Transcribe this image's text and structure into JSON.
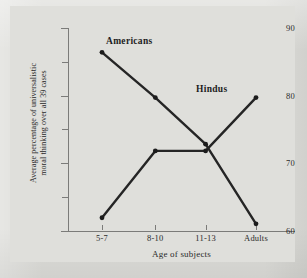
{
  "figure": {
    "background_color": "#dcdcd8",
    "plot_background_color": "#dfdfdb",
    "axis_color": "#7b7b79",
    "line_color": "#252525"
  },
  "chart_data": {
    "type": "line",
    "title": "",
    "xlabel": "Age of subjects",
    "ylabel": "Average percentage of universalistic moral thinking over all 39 cases",
    "ylabel_line1": "Average percentage of universalistic",
    "ylabel_line2": "moral thinking over all 39 cases",
    "categories": [
      "5-7",
      "8-10",
      "11-13",
      "Adults"
    ],
    "ylim": [
      60,
      90
    ],
    "yticks": [
      60,
      70,
      80,
      90
    ],
    "ytick_labels": [
      "60",
      "70",
      "80",
      "90"
    ],
    "yminor_ticks": [
      65,
      75,
      85
    ],
    "grid": false,
    "legend_position": "inline-annotations",
    "series": [
      {
        "name": "Americans",
        "values": [
          86.4,
          79.7,
          72.8,
          61.0
        ],
        "marker": "filled-circle"
      },
      {
        "name": "Hindus",
        "values": [
          61.9,
          71.8,
          71.8,
          79.7
        ],
        "marker": "filled-circle"
      }
    ],
    "annotations": [
      {
        "text": "Americans",
        "series": "Americans"
      },
      {
        "text": "Hindus",
        "series": "Hindus"
      }
    ]
  }
}
